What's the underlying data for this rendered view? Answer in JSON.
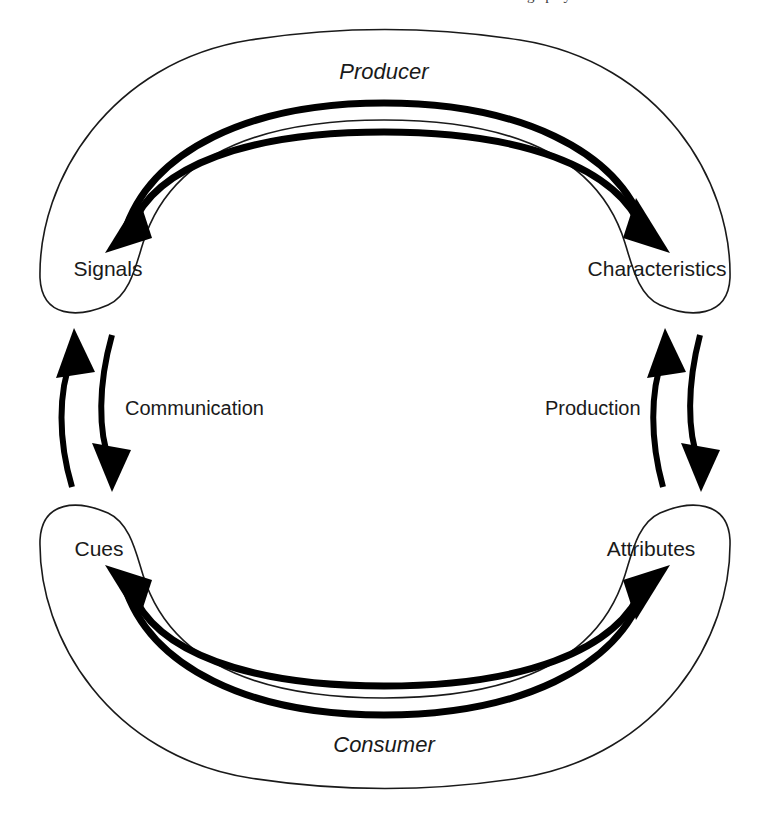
{
  "figure": {
    "title_partial_cut_top": "ng   p   y",
    "background_color": "#ffffff",
    "stroke_color": "#1a1a1a",
    "arrow_color": "#000000"
  },
  "zones": [
    {
      "id": "producer",
      "label": "Producer",
      "style": "italic",
      "position": "top-arch"
    },
    {
      "id": "consumer",
      "label": "Consumer",
      "style": "italic",
      "position": "bottom-arch"
    }
  ],
  "nodes": [
    {
      "id": "signals",
      "label": "Signals",
      "position": "top-left"
    },
    {
      "id": "characteristics",
      "label": "Characteristics",
      "position": "top-right"
    },
    {
      "id": "cues",
      "label": "Cues",
      "position": "bottom-left"
    },
    {
      "id": "attributes",
      "label": "Attributes",
      "position": "bottom-right"
    }
  ],
  "edge_labels": [
    {
      "id": "communication",
      "label": "Communication",
      "side": "left"
    },
    {
      "id": "production",
      "label": "Production",
      "side": "right"
    }
  ],
  "arrows": [
    {
      "id": "signals-to-characteristics",
      "from": "Signals",
      "to": "Characteristics",
      "via": "Producer",
      "direction": "right"
    },
    {
      "id": "characteristics-to-signals",
      "from": "Characteristics",
      "to": "Signals",
      "via": "Producer",
      "direction": "left"
    },
    {
      "id": "cues-to-attributes",
      "from": "Cues",
      "to": "Attributes",
      "via": "Consumer",
      "direction": "right"
    },
    {
      "id": "attributes-to-cues",
      "from": "Attributes",
      "to": "Cues",
      "via": "Consumer",
      "direction": "left"
    },
    {
      "id": "cues-to-signals",
      "from": "Cues",
      "to": "Signals",
      "via": "Communication",
      "direction": "up"
    },
    {
      "id": "signals-to-cues",
      "from": "Signals",
      "to": "Cues",
      "via": "Communication",
      "direction": "down"
    },
    {
      "id": "attributes-to-characteristics",
      "from": "Attributes",
      "to": "Characteristics",
      "via": "Production",
      "direction": "up"
    },
    {
      "id": "characteristics-to-attributes",
      "from": "Characteristics",
      "to": "Attributes",
      "via": "Production",
      "direction": "down"
    }
  ]
}
